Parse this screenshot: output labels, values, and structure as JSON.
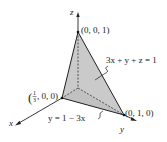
{
  "diagram": {
    "type": "3d-coordinate-plane",
    "axes": {
      "x_label": "x",
      "y_label": "y",
      "z_label": "z"
    },
    "points": {
      "z_intercept": "(0, 0, 1)",
      "x_intercept_open": "(",
      "x_intercept_frac_num": "1",
      "x_intercept_frac_den": "3",
      "x_intercept_rest": ", 0, 0)",
      "y_intercept": "(0, 1, 0)"
    },
    "plane_equation": "3x + y + z = 1",
    "trace_equation": "y = 1 − 3x",
    "colors": {
      "plane_fill": "#c8c8c8",
      "base_fill": "#b4b4b4",
      "lines": "#222222"
    }
  }
}
